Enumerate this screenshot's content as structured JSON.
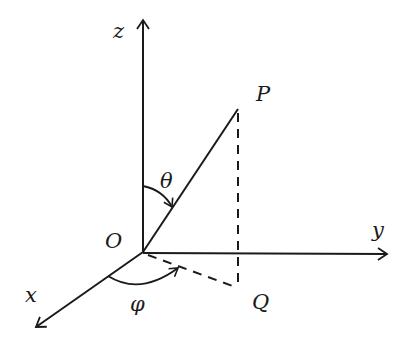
{
  "diagram": {
    "type": "spherical-coordinates",
    "labels": {
      "z_axis": "z",
      "y_axis": "y",
      "x_axis": "x",
      "origin": "O",
      "point_p": "P",
      "point_q": "Q",
      "polar_angle": "θ",
      "azimuth_angle": "φ"
    },
    "colors": {
      "ink": "#1a1a1a",
      "background": "#ffffff"
    }
  }
}
